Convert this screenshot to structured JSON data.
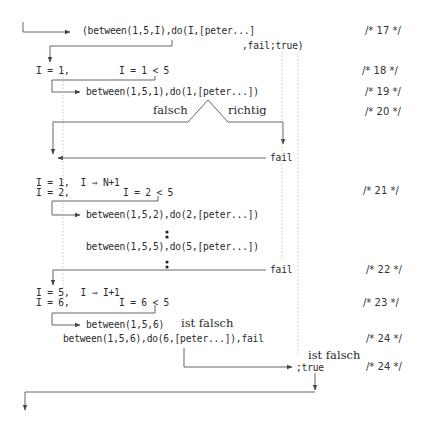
{
  "diagram": {
    "rows": {
      "r17_call": "(between(1,5,I),do(I,[peter...]",
      "r17_tail": ",fail;true)",
      "r18_assign": "I = 1,",
      "r18_test": "I = 1 < 5",
      "r19_call": "between(1,5,1),do(1,[peter...])",
      "r20_false": "falsch",
      "r20_true": "richtig",
      "r20_fail": "fail",
      "r21_assign1": "I = 1,  I ⇒ N+1",
      "r21_assign2": "I = 2,",
      "r21_test": "I = 2 < 5",
      "r21_call2": "between(1,5,2),do(2,[peter...])",
      "r21_call5": "between(1,5,5),do(5,[peter...])",
      "r22_fail": "fail",
      "r23_assign1": "I = 5,  I ⇒ I+1",
      "r23_assign2": "I = 6,",
      "r23_test": "I = 6 < 5",
      "r24_call": "between(1,5,6)",
      "r24_false": "ist falsch",
      "r24_full": "between(1,5,6),do(6,[peter...]),fail",
      "r24b_false": "ist falsch",
      "r24b_true": ";true"
    },
    "comments": {
      "c17": "/* 17 */",
      "c18": "/* 18 */",
      "c19": "/* 19 */",
      "c20": "/* 20 */",
      "c21": "/* 21 */",
      "c22": "/* 22 */",
      "c23": "/* 23 */",
      "c24a": "/* 24 */",
      "c24b": "/* 24 */"
    },
    "colors": {
      "line": "#555555",
      "dotted": "#b0b0b0",
      "text": "#2a2a2a"
    }
  }
}
